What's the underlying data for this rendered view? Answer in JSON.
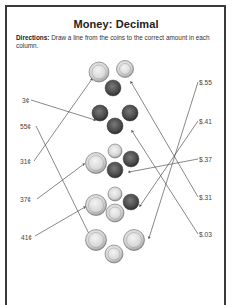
{
  "worksheet": {
    "title": "Money: Decimal",
    "directions_label": "Directions:",
    "directions_text": "Draw a line from the coins to the correct amount in each column."
  },
  "left_column": [
    {
      "label": "3¢",
      "x": 22,
      "y": 97
    },
    {
      "label": "55¢",
      "x": 20,
      "y": 123
    },
    {
      "label": "31¢",
      "x": 20,
      "y": 158
    },
    {
      "label": "37¢",
      "x": 20,
      "y": 196
    },
    {
      "label": "41¢",
      "x": 21,
      "y": 234
    }
  ],
  "right_column": [
    {
      "label": "$.55",
      "x": 199,
      "y": 79
    },
    {
      "label": "$.41",
      "x": 199,
      "y": 118
    },
    {
      "label": "$.37",
      "x": 199,
      "y": 156
    },
    {
      "label": "$.31",
      "x": 199,
      "y": 194
    },
    {
      "label": "$.03",
      "x": 199,
      "y": 231
    }
  ],
  "coin_groups": [
    {
      "name": "group-31-cents",
      "coins": [
        "quarter",
        "nickel",
        "penny"
      ],
      "total": "31¢"
    },
    {
      "name": "group-3-cents",
      "coins": [
        "penny",
        "penny",
        "penny"
      ],
      "total": "3¢"
    },
    {
      "name": "group-37-cents",
      "coins": [
        "quarter",
        "dime",
        "penny",
        "penny"
      ],
      "total": "37¢"
    },
    {
      "name": "group-41-cents",
      "coins": [
        "quarter",
        "dime",
        "penny",
        "nickel"
      ],
      "total": "41¢"
    },
    {
      "name": "group-55-cents",
      "coins": [
        "quarter",
        "nickel",
        "quarter"
      ],
      "total": "55¢"
    }
  ],
  "colors": {
    "border": "#3a3a3a",
    "silver_coin": "#dcdcdc",
    "penny": "#4a4a4a",
    "line": "#555555"
  }
}
